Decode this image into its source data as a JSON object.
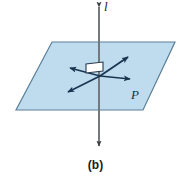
{
  "figure": {
    "caption": "(b)",
    "line_label": "l",
    "plane_label": "P",
    "colors": {
      "plane_fill": "#bfdcee",
      "plane_stroke": "#5a7f99",
      "line_stroke": "#6f7579",
      "ray_stroke": "#1b3550",
      "square_fill": "#ffffff",
      "square_stroke": "#2a3a4a",
      "text": "#1a1a1a",
      "background": "#ffffff"
    },
    "geometry": {
      "plane_points": "52,42 175,42 143,110 16,110",
      "vertical_line": {
        "x": 99,
        "y_top": 6,
        "y_bottom": 147
      },
      "intersection_point": {
        "x": 100,
        "y": 76
      },
      "rays": [
        {
          "name": "ray-upper-right",
          "tip_x": 129,
          "tip_y": 56
        },
        {
          "name": "ray-lower-left",
          "tip_x": 67,
          "tip_y": 93
        },
        {
          "name": "ray-left",
          "tip_x": 69,
          "tip_y": 68
        },
        {
          "name": "ray-right",
          "tip_x": 131,
          "tip_y": 79
        }
      ],
      "right_angle_square": "86,72 86,63 103,63 103,72"
    }
  }
}
